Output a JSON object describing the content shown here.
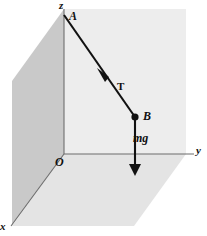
{
  "figure": {
    "background_color": "#ffffff",
    "geometry": {
      "origin": {
        "x": 64,
        "y": 154
      },
      "z_axis_top": {
        "x": 64,
        "y": 9
      },
      "y_axis_end": {
        "x": 194,
        "y": 154
      },
      "x_axis_end": {
        "x": 12,
        "y": 225
      },
      "point_A": {
        "x": 64,
        "y": 15
      },
      "point_B": {
        "x": 135,
        "y": 117
      },
      "mg_arrow_tip": {
        "x": 135,
        "y": 175
      },
      "tension_arrow_tip": {
        "x": 98,
        "y": 70
      }
    },
    "planes": [
      {
        "name": "xz-plane-left",
        "color": "#c8c8c8",
        "points": "12,225 12,81 64,9 64,154"
      },
      {
        "name": "yz-plane-back",
        "color": "#ededed",
        "points": "64,9 186,9 186,154 64,154"
      },
      {
        "name": "xy-plane-floor",
        "color": "#e2e2e2",
        "points": "64,154 186,154 134,226 12,226"
      }
    ],
    "axes": [
      {
        "id": "z",
        "label": "z",
        "stroke": "#6a6a6a"
      },
      {
        "id": "y",
        "label": "y",
        "stroke": "#6a6a6a"
      },
      {
        "id": "x",
        "label": "x",
        "stroke": "#6a6a6a"
      }
    ],
    "points": [
      {
        "id": "A",
        "label": "A",
        "marker": "none"
      },
      {
        "id": "O",
        "label": "O",
        "marker": "none"
      },
      {
        "id": "B",
        "label": "B",
        "marker": "filled-dot"
      }
    ],
    "vectors": [
      {
        "id": "tension",
        "label": "T",
        "style": "bold-upright",
        "description": "cord tension from B toward A",
        "color": "#101010"
      },
      {
        "id": "weight",
        "label": "mg",
        "style": "bold-italic",
        "description": "weight acting vertically downward from B",
        "color": "#101010"
      }
    ],
    "colors": {
      "plane_dark": "#c8c8c8",
      "plane_light": "#ededed",
      "plane_floor": "#e2e2e2",
      "axis_line": "#6a6a6a",
      "vector_line": "#101010",
      "text": "#101010"
    }
  }
}
